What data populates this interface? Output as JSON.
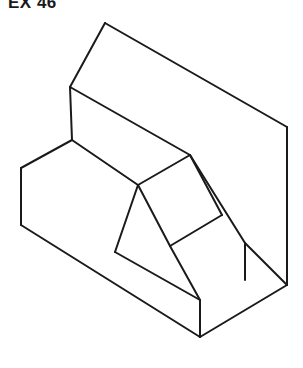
{
  "figure": {
    "label": "EX 46",
    "background_color": "#ffffff",
    "line_color": "#1a1a1a",
    "face_color": "#ffffff",
    "line_width": 2,
    "canvas": {
      "width": 303,
      "height": 368
    },
    "projection": "isometric",
    "view": "front-top-left pictorial",
    "faces": [
      {
        "name": "top-inclined-slab-face",
        "points": "105,23 287,127 190,155 70,87"
      },
      {
        "name": "upper-left-end-face",
        "points": "70,87 190,155 138,185 72,140"
      },
      {
        "name": "left-vertical-block-face",
        "points": "21,168 72,140 138,185 115,252 21,225"
      },
      {
        "name": "front-lower-left-face",
        "points": "21,225 115,252 200,337 200,300"
      },
      {
        "name": "central-quad-face",
        "points": "138,185 190,155 222,215 170,246"
      },
      {
        "name": "right-inclined-face",
        "points": "190,155 287,127 287,285 245,243"
      },
      {
        "name": "front-right-face",
        "points": "200,337 245,243 287,285 287,300"
      }
    ],
    "edges": [
      {
        "name": "top-slab-upper-left-edge",
        "d": "M 105,23 L 70,87"
      },
      {
        "name": "top-slab-ridge-edge",
        "d": "M 105,23 L 287,127"
      },
      {
        "name": "top-slab-right-corner-edge",
        "d": "M 287,127 L 287,285"
      },
      {
        "name": "top-slab-lower-left-edge",
        "d": "M 70,87 L 190,155"
      },
      {
        "name": "slab-end-vertical-edge",
        "d": "M 70,87 L 72,140"
      },
      {
        "name": "slab-end-lower-edge",
        "d": "M 72,140 L 138,185"
      },
      {
        "name": "slab-inner-diagonal-edge",
        "d": "M 138,185 L 190,155"
      },
      {
        "name": "left-top-edge",
        "d": "M 72,140 L 21,168"
      },
      {
        "name": "left-vertical-edge",
        "d": "M 21,168 L 21,225"
      },
      {
        "name": "left-bottom-edge",
        "d": "M 21,225 L 200,337"
      },
      {
        "name": "front-bottom-vertical-edge",
        "d": "M 200,337 L 200,300"
      },
      {
        "name": "mid-slope-left-edge",
        "d": "M 138,185 L 115,252"
      },
      {
        "name": "mid-slope-bottom-edge",
        "d": "M 115,252 L 200,300"
      },
      {
        "name": "central-quad-lower-left-edge",
        "d": "M 138,185 L 170,246"
      },
      {
        "name": "central-quad-lower-right-edge",
        "d": "M 170,246 L 222,215"
      },
      {
        "name": "central-quad-right-edge",
        "d": "M 222,215 L 190,155"
      },
      {
        "name": "right-slope-edge",
        "d": "M 190,155 L 245,243"
      },
      {
        "name": "right-notch-vertical-edge",
        "d": "M 245,243 L 245,280"
      },
      {
        "name": "right-slope-to-corner-edge",
        "d": "M 245,243 L 287,285"
      },
      {
        "name": "bottom-right-edge",
        "d": "M 200,337 L 287,285"
      },
      {
        "name": "mid-front-vertical-edge",
        "d": "M 170,246 L 200,300"
      }
    ]
  }
}
